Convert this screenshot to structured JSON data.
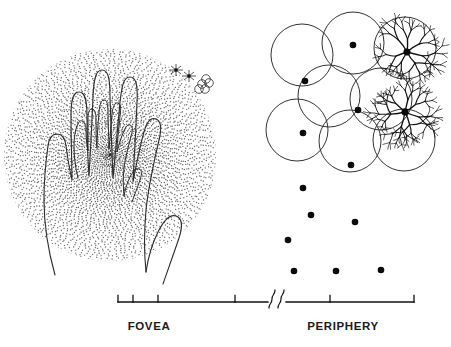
{
  "figure": {
    "background_color": "#ffffff",
    "ink_color": "#111111",
    "dot_color": "#303030"
  },
  "panels": {
    "left": {
      "name": "fovea-panel",
      "description": "Two overlapping hand outlines on a dense radial dot field",
      "dot_field": {
        "center_x": 110,
        "center_y": 155,
        "radius": 106,
        "dot_count": 2600,
        "density": "highest at center, decreasing radially"
      },
      "hands": [
        {
          "name": "large-hand-outline",
          "scale": 1.0
        },
        {
          "name": "small-hand-outline",
          "scale": 0.5
        }
      ],
      "inset_symbols": {
        "name": "inset-periphery-scale-marks",
        "dendrite_marks": 2,
        "circle_cluster_count": 5
      }
    },
    "right": {
      "name": "periphery-panel",
      "description": "Overlapping receptive-field circles with center dots, two dendritic ganglion cells, and sparse dots below",
      "circle_radius": 31,
      "circles": [
        {
          "cx": 302,
          "cy": 55
        },
        {
          "cx": 353,
          "cy": 43
        },
        {
          "cx": 405,
          "cy": 48
        },
        {
          "cx": 329,
          "cy": 96
        },
        {
          "cx": 381,
          "cy": 99
        },
        {
          "cx": 297,
          "cy": 130
        },
        {
          "cx": 350,
          "cy": 141
        },
        {
          "cx": 404,
          "cy": 140
        }
      ],
      "field_center_dots": [
        {
          "cx": 353,
          "cy": 45
        },
        {
          "cx": 407,
          "cy": 52
        },
        {
          "cx": 305,
          "cy": 81
        },
        {
          "cx": 358,
          "cy": 110
        },
        {
          "cx": 405,
          "cy": 112
        },
        {
          "cx": 303,
          "cy": 133
        },
        {
          "cx": 351,
          "cy": 165
        },
        {
          "cx": 303,
          "cy": 188
        }
      ],
      "peripheral_dots": [
        {
          "cx": 311,
          "cy": 215
        },
        {
          "cx": 355,
          "cy": 222
        },
        {
          "cx": 288,
          "cy": 240
        },
        {
          "cx": 294,
          "cy": 271
        },
        {
          "cx": 336,
          "cy": 271
        },
        {
          "cx": 381,
          "cy": 270
        }
      ],
      "ganglion_cells": [
        {
          "name": "ganglion-cell-upper",
          "soma_x": 407,
          "soma_y": 52
        },
        {
          "name": "ganglion-cell-lower",
          "soma_x": 405,
          "soma_y": 112
        }
      ]
    }
  },
  "axis": {
    "name": "eccentricity-axis",
    "y": 302,
    "start_x": 118,
    "end_x": 414,
    "break_symbol": "∫∫",
    "break_x": 275,
    "ticks": [
      {
        "label": "0",
        "degree": true,
        "x": 118
      },
      {
        "label": "0.1",
        "degree": true,
        "x": 133
      },
      {
        "label": "1",
        "degree": true,
        "x": 158
      },
      {
        "label": "5",
        "degree": true,
        "x": 235
      },
      {
        "label": "60",
        "degree": true,
        "x": 330
      },
      {
        "label": "61",
        "degree": true,
        "x": 414
      }
    ],
    "fovea_label": "FOVEA",
    "periphery_label": "PERIPHERY"
  }
}
